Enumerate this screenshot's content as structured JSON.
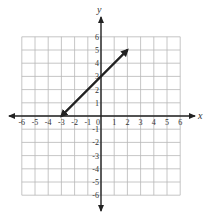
{
  "chart_data": {
    "type": "line",
    "title": "",
    "xlabel": "x",
    "ylabel": "y",
    "xlim": [
      -6,
      6
    ],
    "ylim": [
      -6,
      6
    ],
    "grid": true,
    "x_ticks": [
      -6,
      -5,
      -4,
      -3,
      -2,
      -1,
      0,
      1,
      2,
      3,
      4,
      5,
      6
    ],
    "y_ticks": [
      -6,
      -5,
      -4,
      -3,
      -2,
      -1,
      1,
      2,
      3,
      4,
      5,
      6
    ],
    "x_tick_labels": [
      "-6",
      "-5",
      "-4",
      "-3",
      "-2",
      "-1",
      "0",
      "1",
      "2",
      "3",
      "4",
      "5",
      "6"
    ],
    "y_tick_labels": [
      "-6",
      "-5",
      "-4",
      "-3",
      "-2",
      "-1",
      "1",
      "2",
      "3",
      "4",
      "5",
      "6"
    ],
    "series": [
      {
        "name": "line",
        "points": [
          [
            -3,
            0
          ],
          [
            2,
            5
          ]
        ],
        "x": [
          -3,
          2
        ],
        "y": [
          0,
          5
        ],
        "arrows": "both",
        "slope": 1,
        "y_intercept": 3,
        "x_intercept": -3
      }
    ],
    "colors": {
      "grid": "#b8b8b8",
      "axis": "#222222",
      "line": "#222222",
      "text": "#333333"
    }
  }
}
